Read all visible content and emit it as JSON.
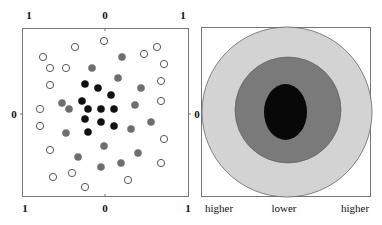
{
  "left_panel": {
    "top_ticks": [
      "1",
      "0",
      "1"
    ],
    "bottom_ticks": [
      "1",
      "0",
      "1"
    ],
    "left_tick": "0",
    "right_tick": "0",
    "colors": {
      "hollow": "#ffffff",
      "gray": "#6e6e6e",
      "black": "#111111",
      "stroke": "#555555"
    },
    "points": [
      {
        "x": 43,
        "y": 57,
        "t": "hollow"
      },
      {
        "x": 50,
        "y": 68,
        "t": "hollow"
      },
      {
        "x": 75,
        "y": 47,
        "t": "hollow"
      },
      {
        "x": 104,
        "y": 41,
        "t": "hollow"
      },
      {
        "x": 66,
        "y": 68,
        "t": "hollow"
      },
      {
        "x": 144,
        "y": 54,
        "t": "hollow"
      },
      {
        "x": 157,
        "y": 47,
        "t": "hollow"
      },
      {
        "x": 164,
        "y": 64,
        "t": "hollow"
      },
      {
        "x": 161,
        "y": 81,
        "t": "hollow"
      },
      {
        "x": 161,
        "y": 101,
        "t": "hollow"
      },
      {
        "x": 50,
        "y": 85,
        "t": "hollow"
      },
      {
        "x": 40,
        "y": 109,
        "t": "hollow"
      },
      {
        "x": 40,
        "y": 126,
        "t": "hollow"
      },
      {
        "x": 164,
        "y": 139,
        "t": "hollow"
      },
      {
        "x": 50,
        "y": 150,
        "t": "hollow"
      },
      {
        "x": 161,
        "y": 163,
        "t": "hollow"
      },
      {
        "x": 53,
        "y": 177,
        "t": "hollow"
      },
      {
        "x": 72,
        "y": 173,
        "t": "hollow"
      },
      {
        "x": 128,
        "y": 180,
        "t": "hollow"
      },
      {
        "x": 85,
        "y": 187,
        "t": "hollow"
      },
      {
        "x": 92,
        "y": 68,
        "t": "gray"
      },
      {
        "x": 122,
        "y": 57,
        "t": "gray"
      },
      {
        "x": 118,
        "y": 78,
        "t": "gray"
      },
      {
        "x": 141,
        "y": 88,
        "t": "gray"
      },
      {
        "x": 135,
        "y": 105,
        "t": "gray"
      },
      {
        "x": 62,
        "y": 103,
        "t": "gray"
      },
      {
        "x": 69,
        "y": 109,
        "t": "gray"
      },
      {
        "x": 66,
        "y": 133,
        "t": "gray"
      },
      {
        "x": 151,
        "y": 122,
        "t": "gray"
      },
      {
        "x": 131,
        "y": 129,
        "t": "gray"
      },
      {
        "x": 104,
        "y": 146,
        "t": "gray"
      },
      {
        "x": 138,
        "y": 153,
        "t": "gray"
      },
      {
        "x": 78,
        "y": 157,
        "t": "gray"
      },
      {
        "x": 121,
        "y": 163,
        "t": "gray"
      },
      {
        "x": 101,
        "y": 167,
        "t": "gray"
      },
      {
        "x": 85,
        "y": 84,
        "t": "black"
      },
      {
        "x": 98,
        "y": 88,
        "t": "black"
      },
      {
        "x": 111,
        "y": 95,
        "t": "black"
      },
      {
        "x": 82,
        "y": 101,
        "t": "black"
      },
      {
        "x": 88,
        "y": 109,
        "t": "black"
      },
      {
        "x": 101,
        "y": 109,
        "t": "black"
      },
      {
        "x": 114,
        "y": 109,
        "t": "black"
      },
      {
        "x": 85,
        "y": 119,
        "t": "black"
      },
      {
        "x": 101,
        "y": 122,
        "t": "black"
      },
      {
        "x": 114,
        "y": 126,
        "t": "black"
      },
      {
        "x": 88,
        "y": 132,
        "t": "black"
      }
    ]
  },
  "right_panel": {
    "left_tick": "0",
    "bottom_labels": [
      "higher",
      "lower",
      "higher"
    ],
    "regions": [
      {
        "name": "outer",
        "color": "#d3d3d3"
      },
      {
        "name": "middle",
        "color": "#7a7a7a"
      },
      {
        "name": "inner",
        "color": "#080808"
      }
    ]
  }
}
